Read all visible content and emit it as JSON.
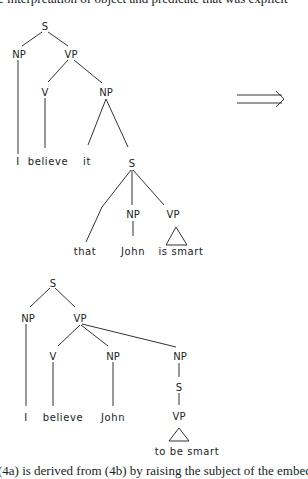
{
  "header_text": "e interpretation of object and predicate that was explicit",
  "footer_text": "(4a) is derived from (4b) by raising the subject of the embedded clause",
  "arrow": {
    "icon": "double-right-arrow-icon",
    "meaning": "transforms-to"
  },
  "trees": [
    {
      "id": "before",
      "nodes": [
        {
          "id": "S",
          "label": "S"
        },
        {
          "id": "NP1",
          "label": "NP"
        },
        {
          "id": "VP1",
          "label": "VP"
        },
        {
          "id": "V",
          "label": "V"
        },
        {
          "id": "NP2",
          "label": "NP"
        },
        {
          "id": "S2",
          "label": "S"
        },
        {
          "id": "NP3",
          "label": "NP"
        },
        {
          "id": "VP2",
          "label": "VP"
        }
      ],
      "leaves": [
        {
          "id": "I",
          "text": "I"
        },
        {
          "id": "believe",
          "text": "believe"
        },
        {
          "id": "it",
          "text": "it"
        },
        {
          "id": "that",
          "text": "that"
        },
        {
          "id": "John",
          "text": "John"
        },
        {
          "id": "smart",
          "text": "is smart"
        }
      ]
    },
    {
      "id": "after",
      "nodes": [
        {
          "id": "S",
          "label": "S"
        },
        {
          "id": "NP1",
          "label": "NP"
        },
        {
          "id": "VP1",
          "label": "VP"
        },
        {
          "id": "V",
          "label": "V"
        },
        {
          "id": "NP2",
          "label": "NP"
        },
        {
          "id": "NP3",
          "label": "NP"
        },
        {
          "id": "S2",
          "label": "S"
        },
        {
          "id": "VP2",
          "label": "VP"
        }
      ],
      "leaves": [
        {
          "id": "I",
          "text": "I"
        },
        {
          "id": "believe",
          "text": "believe"
        },
        {
          "id": "John",
          "text": "John"
        },
        {
          "id": "smart",
          "text": "to be smart"
        }
      ]
    }
  ]
}
